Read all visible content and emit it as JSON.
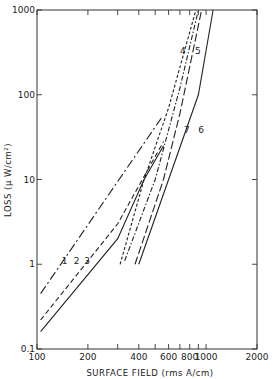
{
  "chart_data": {
    "type": "line",
    "title": "",
    "xlabel": "SURFACE FIELD (rms A/cm)",
    "ylabel": "LOSS (μ W/cm²)",
    "xscale": "log",
    "yscale": "log",
    "xlim": [
      100,
      2000
    ],
    "ylim": [
      0.1,
      1000
    ],
    "x_ticks": [
      100,
      200,
      300,
      400,
      500,
      600,
      700,
      800,
      900,
      1000,
      2000
    ],
    "x_tick_labels": [
      "100",
      "200",
      "",
      "400",
      "",
      "600",
      "",
      "800",
      "",
      "1000",
      "2000"
    ],
    "y_ticks": [
      0.1,
      1,
      10,
      100,
      1000
    ],
    "y_tick_labels": [
      "0.1",
      "1",
      "10",
      "100",
      "1000"
    ],
    "grid": false,
    "legend": "inline curve numbers",
    "series": [
      {
        "name": "1",
        "style": "long-dash-dot",
        "x": [
          105,
          550
        ],
        "y": [
          0.45,
          55
        ]
      },
      {
        "name": "2",
        "style": "dashed",
        "x": [
          105,
          300,
          420,
          560
        ],
        "y": [
          0.22,
          3,
          10,
          28
        ]
      },
      {
        "name": "3",
        "style": "solid",
        "x": [
          105,
          300,
          430,
          560
        ],
        "y": [
          0.16,
          2,
          10,
          25
        ]
      },
      {
        "name": "4",
        "style": "short-dash",
        "x": [
          310,
          430,
          600,
          870
        ],
        "y": [
          1,
          10,
          70,
          1000
        ]
      },
      {
        "name": "5",
        "style": "dash-dot",
        "x": [
          330,
          500,
          700,
          900
        ],
        "y": [
          1.1,
          10,
          120,
          1000
        ]
      },
      {
        "name": "6",
        "style": "solid",
        "x": [
          400,
          600,
          900,
          1100
        ],
        "y": [
          1,
          10,
          100,
          1000
        ]
      },
      {
        "name": "7",
        "style": "long-dash",
        "x": [
          380,
          560,
          700,
          940
        ],
        "y": [
          1,
          10,
          60,
          1000
        ]
      }
    ],
    "curve_labels": [
      {
        "text": "1",
        "x": 140,
        "y": 1.0
      },
      {
        "text": "2",
        "x": 165,
        "y": 1.0
      },
      {
        "text": "3",
        "x": 190,
        "y": 1.0
      },
      {
        "text": "4",
        "x": 700,
        "y": 300
      },
      {
        "text": "5",
        "x": 860,
        "y": 300
      },
      {
        "text": "6",
        "x": 900,
        "y": 35
      },
      {
        "text": "7",
        "x": 740,
        "y": 35
      }
    ]
  }
}
